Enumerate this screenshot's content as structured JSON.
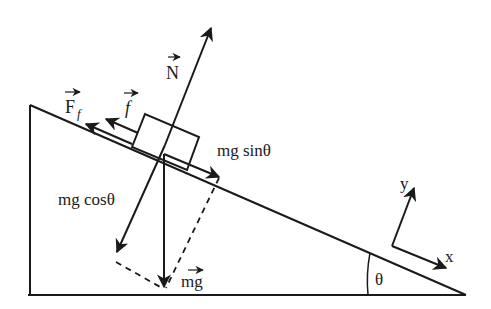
{
  "diagram": {
    "colors": {
      "stroke": "#1a1a1a",
      "background": "#ffffff"
    },
    "labels": {
      "normal_force": "N",
      "friction_total": "F",
      "friction_total_sub": "f",
      "friction": "f",
      "parallel_component": "mg sinθ",
      "perpendicular_component": "mg cosθ",
      "weight": "mg",
      "angle": "θ",
      "axis_x": "x",
      "axis_y": "y"
    }
  }
}
